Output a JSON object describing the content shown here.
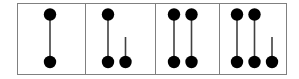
{
  "figure": {
    "title": "",
    "width": 299,
    "height": 79,
    "background": "#ffffff",
    "border_color": "#808080",
    "border_width": 1,
    "node_color": "#000000",
    "edge_color": "#404040",
    "node_radius": 6.2,
    "edge_width": 1.6,
    "frame": {
      "x": 17,
      "y": 3,
      "width": 270,
      "height": 72
    },
    "dividers": [
      85.5,
      155.5,
      219.5
    ]
  },
  "panels": [
    {
      "id": "panel-1",
      "label": "panel-1",
      "x": 17,
      "width": 68.5,
      "nodes": [
        {
          "id": "p1-top-1",
          "cx": 50,
          "cy": 14.5
        },
        {
          "id": "p1-bottom-1",
          "cx": 50,
          "cy": 62
        }
      ],
      "edges": [
        {
          "id": "p1-edge-1",
          "x1": 50,
          "y1": 14.5,
          "x2": 50,
          "y2": 62
        }
      ],
      "stubs": []
    },
    {
      "id": "panel-2",
      "label": "panel-2",
      "x": 85.5,
      "width": 70,
      "nodes": [
        {
          "id": "p2-top-1",
          "cx": 108,
          "cy": 14.5
        },
        {
          "id": "p2-bottom-1",
          "cx": 108,
          "cy": 62
        },
        {
          "id": "p2-bottom-2",
          "cx": 125.5,
          "cy": 62
        }
      ],
      "edges": [
        {
          "id": "p2-edge-1",
          "x1": 108,
          "y1": 14.5,
          "x2": 108,
          "y2": 62
        }
      ],
      "stubs": [
        {
          "id": "p2-stub-1",
          "x1": 125.5,
          "y1": 37,
          "x2": 125.5,
          "y2": 62
        }
      ]
    },
    {
      "id": "panel-3",
      "label": "panel-3",
      "x": 155.5,
      "width": 64,
      "nodes": [
        {
          "id": "p3-top-1",
          "cx": 174,
          "cy": 14.5
        },
        {
          "id": "p3-top-2",
          "cx": 191.5,
          "cy": 14.5
        },
        {
          "id": "p3-bottom-1",
          "cx": 174,
          "cy": 62
        },
        {
          "id": "p3-bottom-2",
          "cx": 191.5,
          "cy": 62
        }
      ],
      "edges": [
        {
          "id": "p3-edge-1",
          "x1": 174,
          "y1": 14.5,
          "x2": 174,
          "y2": 62
        },
        {
          "id": "p3-edge-2",
          "x1": 191.5,
          "y1": 14.5,
          "x2": 191.5,
          "y2": 62
        }
      ],
      "stubs": []
    },
    {
      "id": "panel-4",
      "label": "panel-4",
      "x": 219.5,
      "width": 67.5,
      "nodes": [
        {
          "id": "p4-top-1",
          "cx": 237,
          "cy": 14.5
        },
        {
          "id": "p4-top-2",
          "cx": 254.5,
          "cy": 14.5
        },
        {
          "id": "p4-bottom-1",
          "cx": 237,
          "cy": 62
        },
        {
          "id": "p4-bottom-2",
          "cx": 254.5,
          "cy": 62
        },
        {
          "id": "p4-bottom-3",
          "cx": 272,
          "cy": 62
        }
      ],
      "edges": [
        {
          "id": "p4-edge-1",
          "x1": 237,
          "y1": 14.5,
          "x2": 237,
          "y2": 62
        },
        {
          "id": "p4-edge-2",
          "x1": 254.5,
          "y1": 14.5,
          "x2": 254.5,
          "y2": 62
        }
      ],
      "stubs": [
        {
          "id": "p4-stub-1",
          "x1": 272,
          "y1": 37,
          "x2": 272,
          "y2": 62
        }
      ]
    }
  ]
}
